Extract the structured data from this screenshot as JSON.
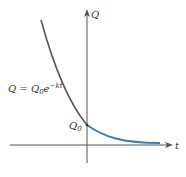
{
  "diagram": {
    "type": "exponential-decay-graph",
    "axes": {
      "x_label": "t",
      "y_label": "Q"
    },
    "equation": {
      "lhs": "Q = Q",
      "sub": "0",
      "base": "e",
      "exponent": "−kt"
    },
    "intercept_label": {
      "main": "Q",
      "sub": "0"
    },
    "colors": {
      "axis": "#555555",
      "curve_left": "#555555",
      "curve_right": "#3f7fae"
    }
  }
}
